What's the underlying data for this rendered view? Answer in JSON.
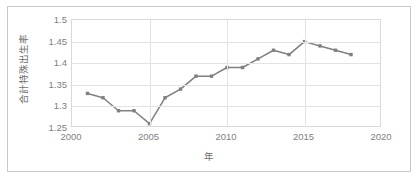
{
  "chart_data": {
    "type": "line",
    "title": "",
    "xlabel": "年",
    "ylabel": "合計特殊出生率",
    "xlim": [
      2000,
      2020
    ],
    "ylim": [
      1.25,
      1.5
    ],
    "grid": true,
    "legend": false,
    "line_color": "#808080",
    "marker_color": "#808080",
    "plot_border_color": "#d9d9d9",
    "gridline_color": "#e3e3e3",
    "tick_label_color": "#808080",
    "axis_title_color": "#6e6e6e",
    "frame_border_color": "#c9c9c9",
    "background_color": "#ffffff",
    "x": [
      2001,
      2002,
      2003,
      2004,
      2005,
      2006,
      2007,
      2008,
      2009,
      2010,
      2011,
      2012,
      2013,
      2014,
      2015,
      2016,
      2017,
      2018
    ],
    "values": [
      1.33,
      1.32,
      1.29,
      1.29,
      1.26,
      1.32,
      1.34,
      1.37,
      1.37,
      1.39,
      1.39,
      1.41,
      1.43,
      1.42,
      1.45,
      1.44,
      1.43,
      1.42
    ],
    "series": [
      {
        "name": "合計特殊出生率",
        "values": [
          1.33,
          1.32,
          1.29,
          1.29,
          1.26,
          1.32,
          1.34,
          1.37,
          1.37,
          1.39,
          1.39,
          1.41,
          1.43,
          1.42,
          1.45,
          1.44,
          1.43,
          1.42
        ]
      }
    ],
    "xticks": [
      2000,
      2005,
      2010,
      2015,
      2020
    ],
    "xtick_labels": [
      "2000",
      "2005",
      "2010",
      "2015",
      "2020"
    ],
    "yticks": [
      1.25,
      1.3,
      1.35,
      1.4,
      1.45,
      1.5
    ],
    "ytick_labels": [
      "1.25",
      "1.3",
      "1.35",
      "1.4",
      "1.45",
      "1.5"
    ]
  }
}
